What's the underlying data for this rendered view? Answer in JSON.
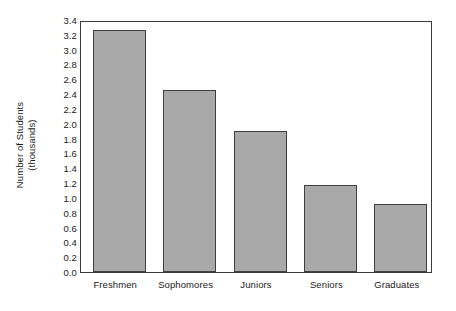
{
  "chart_data": {
    "type": "bar",
    "title": "",
    "xlabel": "",
    "ylabel": "Number of Students (thousands)",
    "ylabel_lines": [
      "Number of Students",
      "(thousands)"
    ],
    "categories": [
      "Freshmen",
      "Sophomores",
      "Juniors",
      "Seniors",
      "Graduates"
    ],
    "values": [
      3.27,
      2.45,
      1.9,
      1.18,
      0.92
    ],
    "ylim": [
      0.0,
      3.4
    ],
    "ytick_step": 0.2,
    "ytick_labels": [
      "3.4",
      "3.2",
      "3.0",
      "2.8",
      "2.6",
      "2.4",
      "2.2",
      "2.0",
      "1.8",
      "1.6",
      "1.4",
      "1.2",
      "1.0",
      "0.8",
      "0.6",
      "0.4",
      "0.2",
      "0.0"
    ],
    "grid": false,
    "legend": null,
    "bar_color": "#a9a9a9",
    "bar_border_color": "#3f3f3f",
    "frame_color": "#3a3a3a"
  }
}
